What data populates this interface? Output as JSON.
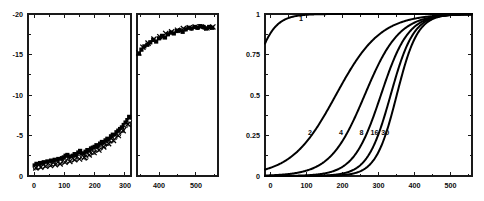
{
  "figure": {
    "background": "#ffffff",
    "ink_color": "#000000",
    "panel_count": 2
  },
  "chart_data": [
    {
      "type": "scatter",
      "id": "left-broken-axis-scatter",
      "title": "",
      "subtitle": "",
      "xlabel": "",
      "ylabel": "",
      "grid": false,
      "legend": "none",
      "broken_axis": true,
      "axis_break_note": "x axis is split into two sub-panels with a gap between ~320 and ~345",
      "y_inverted": true,
      "ylim": [
        0,
        -20
      ],
      "yticks": [
        -20,
        -15,
        -10,
        -5,
        0
      ],
      "yticklabels": [
        "-20",
        "-15",
        "-10",
        "-5",
        "0"
      ],
      "subpanels": [
        {
          "name": "left-subpanel",
          "xlim": [
            -20,
            320
          ],
          "xticks": [
            0,
            100,
            200,
            300
          ],
          "xticklabels": [
            "0",
            "100",
            "200",
            "300"
          ]
        },
        {
          "name": "right-subpanel",
          "xlim": [
            340,
            560
          ],
          "xticks": [
            400,
            500
          ],
          "xticklabels": [
            "400",
            "500"
          ]
        }
      ],
      "series": [
        {
          "name": "filled-square-series",
          "marker": "filled-square",
          "x": [
            2,
            8,
            14,
            20,
            26,
            32,
            38,
            44,
            50,
            56,
            62,
            68,
            74,
            80,
            86,
            92,
            98,
            104,
            110,
            116,
            122,
            128,
            134,
            140,
            146,
            152,
            158,
            164,
            170,
            176,
            182,
            188,
            194,
            200,
            206,
            212,
            218,
            224,
            230,
            236,
            242,
            248,
            254,
            260,
            266,
            272,
            278,
            284,
            290,
            296,
            302,
            308,
            314,
            345,
            352,
            360,
            368,
            376,
            384,
            392,
            400,
            408,
            416,
            424,
            432,
            440,
            448,
            456,
            464,
            472,
            480,
            488,
            496,
            504,
            512,
            520,
            528,
            536,
            544
          ],
          "y": [
            -1.3,
            -1.5,
            -1.4,
            -1.6,
            -1.5,
            -1.7,
            -1.6,
            -1.8,
            -1.7,
            -1.9,
            -1.8,
            -2.0,
            -1.9,
            -2.1,
            -2.0,
            -2.2,
            -2.3,
            -2.5,
            -2.6,
            -2.4,
            -2.3,
            -2.5,
            -2.7,
            -2.6,
            -2.9,
            -3.1,
            -2.8,
            -2.6,
            -3.0,
            -3.2,
            -3.1,
            -3.4,
            -3.5,
            -3.6,
            -3.8,
            -3.7,
            -4.0,
            -4.2,
            -4.1,
            -4.4,
            -4.6,
            -4.5,
            -4.9,
            -5.1,
            -5.0,
            -5.4,
            -5.6,
            -5.8,
            -6.0,
            -6.3,
            -6.6,
            -6.9,
            -7.3,
            -15.1,
            -15.6,
            -16.0,
            -16.2,
            -16.5,
            -16.8,
            -16.6,
            -17.0,
            -17.3,
            -17.1,
            -17.5,
            -17.7,
            -17.6,
            -17.9,
            -18.0,
            -17.8,
            -18.1,
            -18.3,
            -18.2,
            -18.4,
            -18.3,
            -18.5,
            -18.4,
            -18.2,
            -18.4,
            -18.3
          ]
        },
        {
          "name": "open-circle-series",
          "marker": "open-circle",
          "x": [
            4,
            16,
            28,
            40,
            52,
            64,
            76,
            88,
            100,
            112,
            124,
            136,
            148,
            160,
            172,
            184,
            196,
            208,
            220,
            232,
            244,
            256,
            268,
            280,
            292,
            304,
            316
          ],
          "y": [
            -1.0,
            -1.1,
            -1.2,
            -1.3,
            -1.4,
            -1.5,
            -1.6,
            -1.7,
            -1.8,
            -1.9,
            -2.0,
            -2.1,
            -2.3,
            -2.4,
            -2.2,
            -2.7,
            -2.9,
            -3.2,
            -3.4,
            -3.7,
            -4.0,
            -4.3,
            -4.7,
            -5.1,
            -5.6,
            -6.2,
            -6.8
          ]
        },
        {
          "name": "cross-series",
          "marker": "cross",
          "x": [
            6,
            22,
            38,
            54,
            70,
            86,
            102,
            118,
            134,
            150,
            166,
            182,
            198,
            214,
            230,
            246,
            262,
            278,
            294,
            310,
            345,
            356,
            370,
            386,
            402,
            418,
            434,
            450,
            466,
            482,
            498,
            514,
            530,
            546
          ],
          "y": [
            -1.0,
            -1.1,
            -1.2,
            -1.3,
            -1.4,
            -1.5,
            -1.7,
            -1.8,
            -2.0,
            -2.1,
            -2.3,
            -2.6,
            -2.9,
            -3.2,
            -3.6,
            -4.0,
            -4.4,
            -5.0,
            -5.6,
            -6.4,
            -15.2,
            -15.9,
            -16.4,
            -16.9,
            -17.2,
            -17.6,
            -17.8,
            -18.0,
            -18.2,
            -18.3,
            -18.4,
            -18.4,
            -18.3,
            -18.4
          ]
        }
      ]
    },
    {
      "type": "line",
      "id": "right-sigmoid-family",
      "title": "",
      "subtitle": "",
      "xlabel": "",
      "ylabel": "",
      "grid": false,
      "legend": "inline-curve-labels",
      "xlim": [
        -15,
        560
      ],
      "ylim": [
        0,
        1
      ],
      "xticks": [
        0,
        100,
        200,
        300,
        400,
        500
      ],
      "xticklabels": [
        "0",
        "100",
        "200",
        "300",
        "400",
        "500"
      ],
      "yticks": [
        0,
        0.25,
        0.5,
        0.75,
        1
      ],
      "yticklabels": [
        "0",
        "0.25",
        "0.5",
        "0.75",
        "1"
      ],
      "series": [
        {
          "name": "1",
          "label": "1",
          "label_x": 85,
          "label_y": 0.955,
          "midpoint": -60,
          "steepness": 30,
          "plateau": 1.0
        },
        {
          "name": "2",
          "label": "2",
          "label_x": 110,
          "label_y": 0.255,
          "midpoint": 182,
          "steepness": 62,
          "plateau": 1.0
        },
        {
          "name": "4",
          "label": "4",
          "label_x": 196,
          "label_y": 0.255,
          "midpoint": 262,
          "steepness": 48,
          "plateau": 1.0
        },
        {
          "name": "8",
          "label": "8",
          "label_x": 253,
          "label_y": 0.255,
          "midpoint": 307,
          "steepness": 38,
          "plateau": 1.0
        },
        {
          "name": "16",
          "label": "16",
          "label_x": 289,
          "label_y": 0.255,
          "midpoint": 334,
          "steepness": 32,
          "plateau": 1.0
        },
        {
          "name": "30",
          "label": "30",
          "label_x": 319,
          "label_y": 0.255,
          "midpoint": 351,
          "steepness": 29,
          "plateau": 1.0
        }
      ]
    }
  ]
}
